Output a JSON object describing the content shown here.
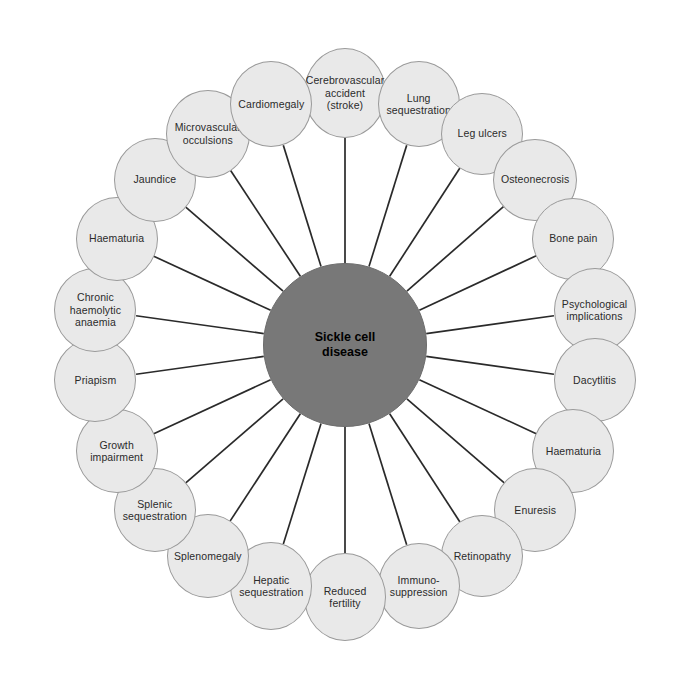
{
  "diagram": {
    "type": "radial-hub-and-spoke",
    "center": {
      "label": "Sickle cell\ndisease",
      "fill_color": "#787878",
      "text_color": "#000000",
      "radius_px": 82,
      "cx": 345,
      "cy": 345
    },
    "style": {
      "node_fill": "#e9e9e9",
      "node_border": "#9a9a9a",
      "spoke_color": "#2a2a2a",
      "background": "#ffffff",
      "node_radius_px": 41,
      "ring_radius_px": 252
    },
    "nodes": [
      {
        "label": "Cerebrovascular\naccident\n(stroke)",
        "angle_deg": -90,
        "rx": 41,
        "ry": 45
      },
      {
        "label": "Lung\nsequestration",
        "angle_deg": -73,
        "rx": 41,
        "ry": 43
      },
      {
        "label": "Leg ulcers",
        "angle_deg": -57,
        "rx": 41,
        "ry": 41
      },
      {
        "label": "Osteonecrosis",
        "angle_deg": -41,
        "rx": 42,
        "ry": 41
      },
      {
        "label": "Bone pain",
        "angle_deg": -25,
        "rx": 41,
        "ry": 41
      },
      {
        "label": "Psychological\nimplications",
        "angle_deg": -8,
        "rx": 41,
        "ry": 42
      },
      {
        "label": "Dacytlitis",
        "angle_deg": 8,
        "rx": 41,
        "ry": 42
      },
      {
        "label": "Haematuria",
        "angle_deg": 25,
        "rx": 41,
        "ry": 42
      },
      {
        "label": "Enuresis",
        "angle_deg": 41,
        "rx": 41,
        "ry": 42
      },
      {
        "label": "Retinopathy",
        "angle_deg": 57,
        "rx": 41,
        "ry": 41
      },
      {
        "label": "Immuno-\nsuppression",
        "angle_deg": 73,
        "rx": 41,
        "ry": 43
      },
      {
        "label": "Reduced\nfertility",
        "angle_deg": 90,
        "rx": 41,
        "ry": 44
      },
      {
        "label": "Hepatic\nsequestration",
        "angle_deg": 107,
        "rx": 41,
        "ry": 44
      },
      {
        "label": "Splenomegaly",
        "angle_deg": 123,
        "rx": 41,
        "ry": 42
      },
      {
        "label": "Splenic\nsequestration",
        "angle_deg": 139,
        "rx": 41,
        "ry": 42
      },
      {
        "label": "Growth\nimpairment",
        "angle_deg": 155,
        "rx": 41,
        "ry": 42
      },
      {
        "label": "Priapism",
        "angle_deg": 172,
        "rx": 41,
        "ry": 42
      },
      {
        "label": "Chronic\nhaemolytic\nanaemia",
        "angle_deg": 188,
        "rx": 41,
        "ry": 42
      },
      {
        "label": "Haematuria",
        "angle_deg": 205,
        "rx": 41,
        "ry": 42
      },
      {
        "label": "Jaundice",
        "angle_deg": 221,
        "rx": 41,
        "ry": 42
      },
      {
        "label": "Microvascular\nocculsions",
        "angle_deg": 237,
        "rx": 42,
        "ry": 44
      },
      {
        "label": "Cardiomegaly",
        "angle_deg": 253,
        "rx": 41,
        "ry": 43
      }
    ]
  }
}
